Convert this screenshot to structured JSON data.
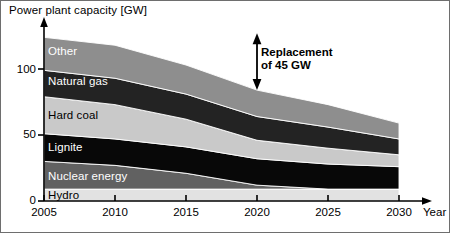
{
  "chart_data": {
    "type": "area",
    "stacked": true,
    "title": "",
    "ylabel": "Power plant capacity [GW]",
    "xlabel": "Year",
    "xlim": [
      2005,
      2030
    ],
    "ylim": [
      0,
      120
    ],
    "yticks": [
      0,
      50,
      100
    ],
    "ytick_labels": [
      "0",
      "50",
      "100"
    ],
    "xticks": [
      2005,
      2010,
      2015,
      2020,
      2025,
      2030
    ],
    "xtick_labels": [
      "2005",
      "2010",
      "2015",
      "2020",
      "2025",
      "2030"
    ],
    "grid": false,
    "legend": "inline-band-labels",
    "x": [
      2005,
      2010,
      2015,
      2020,
      2025,
      2030
    ],
    "series": [
      {
        "name": "Hydro",
        "color": "#e2e2e2",
        "label_color": "#000000",
        "values": [
          9,
          9,
          9,
          9,
          9,
          9
        ]
      },
      {
        "name": "Nuclear energy",
        "color": "#616161",
        "label_color": "#ffffff",
        "values": [
          21,
          18,
          12,
          3,
          0,
          0
        ]
      },
      {
        "name": "Lignite",
        "color": "#080808",
        "label_color": "#ffffff",
        "values": [
          21,
          20,
          20,
          20,
          19,
          17
        ]
      },
      {
        "name": "Hard coal",
        "color": "#c9c9c9",
        "label_color": "#000000",
        "values": [
          28,
          26,
          21,
          14,
          12,
          9
        ]
      },
      {
        "name": "Natural gas",
        "color": "#232323",
        "label_color": "#ffffff",
        "values": [
          20,
          20,
          19,
          18,
          16,
          12
        ]
      },
      {
        "name": "Other",
        "color": "#8e8e8e",
        "label_color": "#ffffff",
        "values": [
          25,
          25,
          22,
          20,
          17,
          12
        ]
      }
    ],
    "totals": [
      124,
      118,
      103,
      84,
      73,
      59
    ],
    "annotations": [
      {
        "name": "replacement-arrow",
        "line1": "Replacement",
        "line2": "of 45 GW",
        "at_year": 2020,
        "from_gw": 84,
        "to_gw": 127,
        "value_gw": 45
      }
    ]
  },
  "labels": {
    "y_axis_title": "Power plant capacity [GW]",
    "x_axis_name": "Year"
  }
}
